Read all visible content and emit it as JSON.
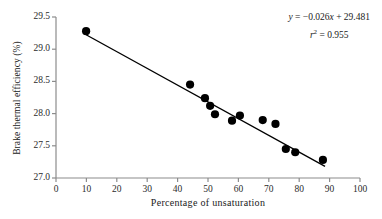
{
  "chart_data": {
    "type": "scatter",
    "title": "",
    "xlabel": "Percentage  of  unsaturation",
    "ylabel": "Brake thermal efficiency (%)",
    "xlim": [
      0,
      100
    ],
    "ylim": [
      27.0,
      29.5
    ],
    "xticks": [
      0,
      10,
      20,
      30,
      40,
      50,
      60,
      70,
      80,
      90,
      100
    ],
    "xtick_labels": [
      "0",
      "10",
      "20",
      "30",
      "40",
      "50",
      "60",
      "70",
      "80",
      "90",
      "100"
    ],
    "yticks": [
      27.0,
      27.5,
      28.0,
      28.5,
      29.0,
      29.5
    ],
    "ytick_labels": [
      "27.0",
      "27.5",
      "28.0",
      "28.5",
      "29.0",
      "29.5"
    ],
    "grid": false,
    "legend": null,
    "series": [
      {
        "name": "Brake thermal efficiency vs percentage of unsaturation",
        "marker": "filled-circle",
        "color": "#000000",
        "points": [
          {
            "x": 9.9,
            "y": 29.28
          },
          {
            "x": 44.1,
            "y": 28.45
          },
          {
            "x": 49.0,
            "y": 28.24
          },
          {
            "x": 50.7,
            "y": 28.12
          },
          {
            "x": 52.3,
            "y": 27.99
          },
          {
            "x": 57.9,
            "y": 27.89
          },
          {
            "x": 60.5,
            "y": 27.97
          },
          {
            "x": 68.0,
            "y": 27.9
          },
          {
            "x": 72.2,
            "y": 27.84
          },
          {
            "x": 75.6,
            "y": 27.45
          },
          {
            "x": 78.7,
            "y": 27.4
          },
          {
            "x": 87.8,
            "y": 27.28
          }
        ]
      }
    ],
    "fit_line": {
      "type": "linear-regression",
      "slope": -0.026,
      "intercept": 29.481,
      "r_squared": 0.955,
      "x_start": 9.9,
      "x_end": 88.5,
      "color": "#000000"
    },
    "annotations": {
      "equation": "y = −0.026x + 29.481",
      "equation_parts": {
        "lhs": "y",
        "equals": " = ",
        "rhs": "−0.026x + 29.481"
      },
      "r_squared_label": "r",
      "r_squared_exponent": "2",
      "r_squared_value": " = 0.955"
    }
  },
  "axes": {
    "axis_color": "#8c8c8c",
    "tick_color": "#8c8c8c",
    "marker_color": "#000000",
    "line_color": "#111111",
    "text_color": "#1a1a1a"
  }
}
